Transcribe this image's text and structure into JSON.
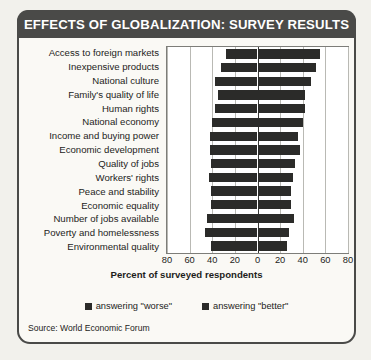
{
  "title": "EFFECTS OF GLOBALIZATION: SURVEY RESULTS",
  "source": "Source: World Economic Forum",
  "legend": {
    "worse_label": "answering \"worse\"",
    "better_label": "answering \"better\""
  },
  "colors": {
    "bar": "#2b2b29",
    "banner": "#4a4a48",
    "card_bg": "#faf9f5",
    "page_bg": "#f2f1ec",
    "grid": "#b9b9b4",
    "zero_line": "#3a3a38",
    "text": "#1d1d1b"
  },
  "chart_data": {
    "type": "bar",
    "orientation": "horizontal",
    "style": "diverging-bidirectional",
    "title": "EFFECTS OF GLOBALIZATION: SURVEY RESULTS",
    "xlabel": "Percent of surveyed respondents",
    "ylabel": "",
    "xlim": [
      -80,
      80
    ],
    "xticks": [
      -80,
      -60,
      -40,
      -20,
      0,
      20,
      40,
      60,
      80
    ],
    "xticklabels": [
      "80",
      "60",
      "40",
      "20",
      "0",
      "20",
      "40",
      "60",
      "80"
    ],
    "grid": true,
    "legend_position": "bottom",
    "categories": [
      "Access to foreign markets",
      "Inexpensive products",
      "National culture",
      "Family's quality of life",
      "Human rights",
      "National economy",
      "Income and buying power",
      "Economic development",
      "Quality of jobs",
      "Workers' rights",
      "Peace and stability",
      "Economic equality",
      "Number of jobs available",
      "Poverty and homelessness",
      "Environmental quality"
    ],
    "series": [
      {
        "name": "answering \"worse\"",
        "direction": "left",
        "values": [
          28,
          32,
          38,
          35,
          38,
          40,
          42,
          42,
          41,
          43,
          41,
          41,
          45,
          46,
          41
        ]
      },
      {
        "name": "answering \"better\"",
        "direction": "right",
        "values": [
          55,
          52,
          47,
          42,
          42,
          40,
          36,
          38,
          33,
          31,
          30,
          30,
          32,
          28,
          26
        ]
      }
    ]
  }
}
